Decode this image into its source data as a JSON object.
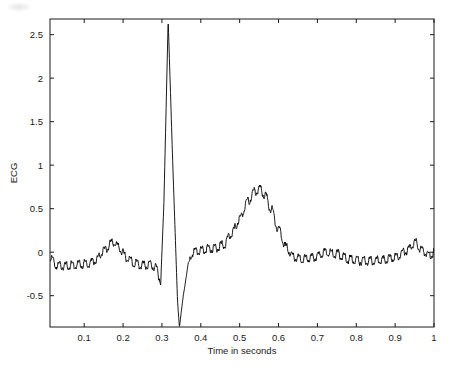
{
  "figure": {
    "background_color": "#ffffff",
    "axes_color": "#1a1a1a",
    "line_color": "#000000"
  },
  "axis": {
    "x_title": "Time in seconds",
    "y_title": "ECG",
    "x_ticks": [
      "0.1",
      "0.2",
      "0.3",
      "0.4",
      "0.5",
      "0.6",
      "0.7",
      "0.8",
      "0.9",
      "1"
    ],
    "y_ticks": [
      "-0.5",
      "0",
      "0.5",
      "1",
      "1.5",
      "2",
      "2.5"
    ]
  },
  "chart_data": {
    "type": "line",
    "title": "",
    "subtitle": "",
    "xlabel": "Time in seconds",
    "ylabel": "ECG",
    "xlim": [
      0.012,
      1.0
    ],
    "ylim": [
      -0.86,
      2.68
    ],
    "xticks": [
      0.1,
      0.2,
      0.3,
      0.4,
      0.5,
      0.6,
      0.7,
      0.8,
      0.9,
      1.0
    ],
    "yticks": [
      -0.5,
      0,
      0.5,
      1,
      1.5,
      2,
      2.5
    ],
    "grid": false,
    "legend": null,
    "annotations": [],
    "series": [
      {
        "name": "ECG",
        "color": "#000000",
        "description": "Single-beat electrocardiogram with 60 Hz powerline noise riding on the trace",
        "sample_rate_hz": 1000,
        "features": {
          "p_wave": {
            "center_s": 0.175,
            "amplitude": 0.12,
            "width_s": 0.075
          },
          "q_wave": {
            "center_s": 0.297,
            "amplitude": -0.33
          },
          "r_wave": {
            "center_s": 0.316,
            "amplitude": 2.67
          },
          "s_wave": {
            "center_s": 0.345,
            "amplitude": -0.86
          },
          "st_segment": {
            "start_s": 0.375,
            "end_s": 0.46,
            "level": 0.02
          },
          "t_wave": {
            "center_s": 0.551,
            "amplitude": 0.73,
            "width_s": 0.11
          },
          "p_wave_2": {
            "center_s": 0.952,
            "amplitude": 0.12,
            "width_s": 0.06
          },
          "baseline_level": -0.15,
          "noise_frequency_hz": 60,
          "noise_amplitude": 0.045
        },
        "x": [
          0.012,
          0.03,
          0.05,
          0.07,
          0.09,
          0.11,
          0.13,
          0.15,
          0.17,
          0.175,
          0.19,
          0.21,
          0.23,
          0.25,
          0.27,
          0.285,
          0.297,
          0.305,
          0.316,
          0.328,
          0.34,
          0.345,
          0.355,
          0.368,
          0.38,
          0.4,
          0.42,
          0.44,
          0.46,
          0.48,
          0.5,
          0.52,
          0.54,
          0.551,
          0.565,
          0.58,
          0.6,
          0.62,
          0.64,
          0.66,
          0.69,
          0.72,
          0.75,
          0.78,
          0.81,
          0.84,
          0.87,
          0.9,
          0.93,
          0.952,
          0.97,
          0.99,
          1.0
        ],
        "y": [
          -0.07,
          -0.15,
          -0.16,
          -0.15,
          -0.14,
          -0.13,
          -0.09,
          0.02,
          0.1,
          0.12,
          0.05,
          -0.07,
          -0.13,
          -0.15,
          -0.14,
          -0.18,
          -0.33,
          0.55,
          2.67,
          1.0,
          -0.55,
          -0.86,
          -0.5,
          -0.12,
          0.0,
          0.02,
          0.04,
          0.05,
          0.09,
          0.22,
          0.38,
          0.58,
          0.7,
          0.73,
          0.66,
          0.5,
          0.26,
          0.05,
          -0.06,
          -0.08,
          -0.06,
          0.0,
          -0.02,
          -0.08,
          -0.1,
          -0.1,
          -0.09,
          -0.06,
          0.02,
          0.11,
          0.02,
          -0.04,
          0.0
        ]
      }
    ]
  }
}
